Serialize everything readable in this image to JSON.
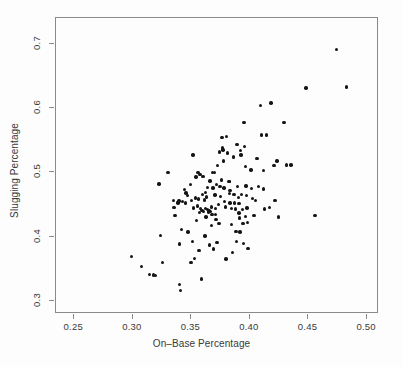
{
  "chart_data": {
    "type": "scatter",
    "title": "",
    "xlabel": "On–Base Percentage",
    "ylabel": "Slugging Percentage",
    "xlim": [
      0.2344,
      0.5102
    ],
    "ylim": [
      0.28,
      0.74
    ],
    "xticks": [
      0.25,
      0.3,
      0.35,
      0.4,
      0.45,
      0.5
    ],
    "xtick_labels": [
      "0.25",
      "0.30",
      "0.35",
      "0.40",
      "0.45",
      "0.50"
    ],
    "yticks": [
      0.3,
      0.4,
      0.5,
      0.6,
      0.7
    ],
    "ytick_labels": [
      "0.3",
      "0.4",
      "0.5",
      "0.6",
      "0.7"
    ],
    "grid": false,
    "legend": null,
    "marker": {
      "shape": "circle",
      "filled": true,
      "color": "#151515",
      "size_px": 3.4
    },
    "n_points": 150,
    "points": [
      [
        0.299,
        0.369
      ],
      [
        0.3075,
        0.354
      ],
      [
        0.314,
        0.341
      ],
      [
        0.3175,
        0.3405
      ],
      [
        0.3195,
        0.34
      ],
      [
        0.3225,
        0.482
      ],
      [
        0.3235,
        0.402
      ],
      [
        0.3255,
        0.36
      ],
      [
        0.33,
        0.4995
      ],
      [
        0.3345,
        0.4565
      ],
      [
        0.335,
        0.4455
      ],
      [
        0.336,
        0.433
      ],
      [
        0.338,
        0.453
      ],
      [
        0.3385,
        0.4525
      ],
      [
        0.3395,
        0.4555
      ],
      [
        0.34,
        0.389
      ],
      [
        0.34,
        0.3255
      ],
      [
        0.3405,
        0.317
      ],
      [
        0.3415,
        0.411
      ],
      [
        0.3425,
        0.455
      ],
      [
        0.344,
        0.4735
      ],
      [
        0.345,
        0.4525
      ],
      [
        0.3465,
        0.4645
      ],
      [
        0.347,
        0.4075
      ],
      [
        0.349,
        0.481
      ],
      [
        0.3495,
        0.36
      ],
      [
        0.35,
        0.456
      ],
      [
        0.351,
        0.3925
      ],
      [
        0.3515,
        0.527
      ],
      [
        0.352,
        0.445
      ],
      [
        0.3525,
        0.366
      ],
      [
        0.3535,
        0.46
      ],
      [
        0.354,
        0.493
      ],
      [
        0.355,
        0.448
      ],
      [
        0.3555,
        0.5
      ],
      [
        0.356,
        0.459
      ],
      [
        0.3565,
        0.379
      ],
      [
        0.357,
        0.4375
      ],
      [
        0.3575,
        0.4965
      ],
      [
        0.358,
        0.4435
      ],
      [
        0.3585,
        0.3345
      ],
      [
        0.359,
        0.441
      ],
      [
        0.3595,
        0.4655
      ],
      [
        0.36,
        0.4935
      ],
      [
        0.3605,
        0.4395
      ],
      [
        0.361,
        0.457
      ],
      [
        0.3615,
        0.4015
      ],
      [
        0.362,
        0.444
      ],
      [
        0.3625,
        0.431
      ],
      [
        0.363,
        0.462
      ],
      [
        0.3635,
        0.4765
      ],
      [
        0.364,
        0.4425
      ],
      [
        0.3645,
        0.438
      ],
      [
        0.365,
        0.44
      ],
      [
        0.3655,
        0.387
      ],
      [
        0.366,
        0.487
      ],
      [
        0.3665,
        0.439
      ],
      [
        0.367,
        0.446
      ],
      [
        0.3675,
        0.4345
      ],
      [
        0.368,
        0.5
      ],
      [
        0.3685,
        0.476
      ],
      [
        0.369,
        0.381
      ],
      [
        0.3695,
        0.4995
      ],
      [
        0.37,
        0.465
      ],
      [
        0.3705,
        0.444
      ],
      [
        0.371,
        0.427
      ],
      [
        0.3715,
        0.4815
      ],
      [
        0.372,
        0.391
      ],
      [
        0.3725,
        0.5105
      ],
      [
        0.373,
        0.45
      ],
      [
        0.3735,
        0.4205
      ],
      [
        0.374,
        0.532
      ],
      [
        0.3745,
        0.478
      ],
      [
        0.375,
        0.463
      ],
      [
        0.3755,
        0.488
      ],
      [
        0.376,
        0.5545
      ],
      [
        0.3765,
        0.538
      ],
      [
        0.377,
        0.535
      ],
      [
        0.3775,
        0.5175
      ],
      [
        0.378,
        0.476
      ],
      [
        0.3785,
        0.4545
      ],
      [
        0.379,
        0.4465
      ],
      [
        0.3795,
        0.3655
      ],
      [
        0.38,
        0.5555
      ],
      [
        0.381,
        0.5305
      ],
      [
        0.382,
        0.4855
      ],
      [
        0.3825,
        0.4675
      ],
      [
        0.383,
        0.4525
      ],
      [
        0.384,
        0.4435
      ],
      [
        0.3845,
        0.419
      ],
      [
        0.385,
        0.3755
      ],
      [
        0.386,
        0.524
      ],
      [
        0.3865,
        0.466
      ],
      [
        0.387,
        0.4525
      ],
      [
        0.3875,
        0.443
      ],
      [
        0.388,
        0.4085
      ],
      [
        0.3885,
        0.3925
      ],
      [
        0.389,
        0.543
      ],
      [
        0.3895,
        0.4785
      ],
      [
        0.39,
        0.461
      ],
      [
        0.3905,
        0.4515
      ],
      [
        0.391,
        0.429
      ],
      [
        0.3915,
        0.4075
      ],
      [
        0.392,
        0.5345
      ],
      [
        0.3925,
        0.527
      ],
      [
        0.393,
        0.4655
      ],
      [
        0.3935,
        0.4425
      ],
      [
        0.394,
        0.4205
      ],
      [
        0.3945,
        0.39
      ],
      [
        0.395,
        0.5775
      ],
      [
        0.3955,
        0.54
      ],
      [
        0.396,
        0.509
      ],
      [
        0.3965,
        0.479
      ],
      [
        0.397,
        0.464
      ],
      [
        0.3975,
        0.445
      ],
      [
        0.398,
        0.4225
      ],
      [
        0.3985,
        0.3815
      ],
      [
        0.401,
        0.504
      ],
      [
        0.4015,
        0.4755
      ],
      [
        0.402,
        0.4595
      ],
      [
        0.4035,
        0.4335
      ],
      [
        0.4045,
        0.4565
      ],
      [
        0.406,
        0.5215
      ],
      [
        0.4075,
        0.478
      ],
      [
        0.409,
        0.6045
      ],
      [
        0.41,
        0.558
      ],
      [
        0.4115,
        0.503
      ],
      [
        0.4125,
        0.443
      ],
      [
        0.414,
        0.558
      ],
      [
        0.4165,
        0.4455
      ],
      [
        0.418,
        0.608
      ],
      [
        0.4205,
        0.511
      ],
      [
        0.4215,
        0.456
      ],
      [
        0.423,
        0.518
      ],
      [
        0.4245,
        0.4305
      ],
      [
        0.429,
        0.5775
      ],
      [
        0.431,
        0.5115
      ],
      [
        0.435,
        0.5115
      ],
      [
        0.448,
        0.631
      ],
      [
        0.4555,
        0.433
      ],
      [
        0.474,
        0.6915
      ],
      [
        0.4825,
        0.633
      ],
      [
        0.3455,
        0.468
      ],
      [
        0.362,
        0.469
      ],
      [
        0.3705,
        0.435
      ],
      [
        0.383,
        0.4715
      ],
      [
        0.3905,
        0.437
      ],
      [
        0.367,
        0.418
      ],
      [
        0.3545,
        0.425
      ],
      [
        0.3825,
        0.4855
      ],
      [
        0.396,
        0.432
      ],
      [
        0.4115,
        0.4745
      ]
    ]
  }
}
